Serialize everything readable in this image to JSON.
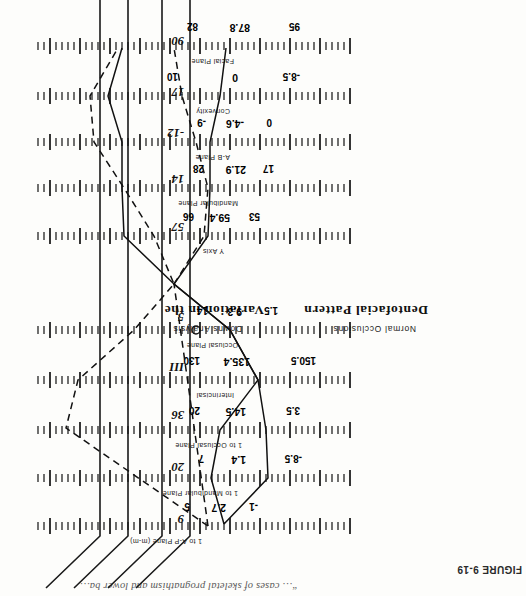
{
  "figure": {
    "label": "FIGURE 9-19",
    "caption": "“… cases of skeletal prognathism and lower ba…"
  },
  "titles": {
    "main_left": "Variation in the",
    "main_right": "Dentofacial Pattern",
    "sub_left": "Downs Analysis",
    "sub_right": "Normal Occlusions"
  },
  "chart_data": {
    "type": "table",
    "subtitle": "Downs Analysis — Normal Occlusions",
    "xlabel": "",
    "ylabel": "",
    "grid": false,
    "legend": "none",
    "note": "Polygon (wiggle) chart: each horizontal ruler is one cephalometric measurement; marks show minimum, mean and maximum of the normal range.",
    "columns": [
      "measurement",
      "min",
      "mean",
      "max",
      "unit"
    ],
    "rows": [
      {
        "measurement": "Facial Plane",
        "min": "95",
        "mean": "87.8",
        "max": "82",
        "unit": "degrees"
      },
      {
        "measurement": "Convexity",
        "min": "-8.5",
        "mean": "0",
        "max": "10",
        "unit": "degrees"
      },
      {
        "measurement": "A-B Plane",
        "min": "0",
        "mean": "-4.6",
        "max": "-9",
        "unit": "degrees"
      },
      {
        "measurement": "Mandibular Plane",
        "min": "17",
        "mean": "21.9",
        "max": "28",
        "unit": "degrees"
      },
      {
        "measurement": "Y Axis",
        "min": "53",
        "mean": "59.4",
        "max": "66",
        "unit": "degrees"
      },
      {
        "measurement": "Occlusal Plane",
        "min": "1.5",
        "mean": "9.3",
        "max": "14",
        "unit": "degrees"
      },
      {
        "measurement": "Interincisal",
        "min": "150.5",
        "mean": "135.4",
        "max": "130",
        "unit": "degrees"
      },
      {
        "measurement": "1 to Occlusal Plane",
        "min": "3.5",
        "mean": "14.5",
        "max": "20",
        "unit": "degrees"
      },
      {
        "measurement": "1 to Mandibular Plane",
        "min": "-8.5",
        "mean": "1.4",
        "max": "7",
        "unit": "degrees"
      },
      {
        "measurement": "1 to A-P Plane (m-m)",
        "min": "-1",
        "mean": "2.7",
        "max": "5",
        "unit": "mm"
      }
    ],
    "scale_numbers": [
      "90",
      "17",
      "-12",
      "14",
      "57",
      "5",
      "III",
      "36",
      "20",
      "9"
    ]
  },
  "rows": [
    {
      "label": "1 to A-P Plane (m-m)",
      "min": "-1",
      "mean": "2.7",
      "max": "5",
      "label_x": 148,
      "min_x": 92,
      "mean_x": 124,
      "max_x": 160
    },
    {
      "label": "1 to Mandibular Plane",
      "min": "-8.5",
      "mean": "1.4",
      "max": "7",
      "label_x": 112,
      "min_x": 48,
      "mean_x": 104,
      "max_x": 146
    },
    {
      "label": "1 to Occlusal Plane",
      "min": "3.5",
      "mean": "14.5",
      "max": "20",
      "label_x": 108,
      "min_x": 50,
      "mean_x": 104,
      "max_x": 150
    },
    {
      "label": "Interincisal",
      "min": "150.5",
      "mean": "135.4",
      "max": "130",
      "label_x": 116,
      "min_x": 34,
      "mean_x": 100,
      "max_x": 150
    },
    {
      "label": "Occlusal Plane",
      "min": "1.5",
      "mean": "9.3",
      "max": "14",
      "label_x": 112,
      "min_x": 72,
      "mean_x": 108,
      "max_x": 142
    },
    {
      "label": "Y Axis",
      "min": "53",
      "mean": "59.4",
      "max": "66",
      "label_x": 126,
      "min_x": 90,
      "mean_x": 120,
      "max_x": 156
    },
    {
      "label": "Mandibular Plane",
      "min": "17",
      "mean": "21.9",
      "max": "28",
      "label_x": 112,
      "min_x": 76,
      "mean_x": 104,
      "max_x": 146
    },
    {
      "label": "A-B Plane",
      "min": "0",
      "mean": "-4.6",
      "max": "-9",
      "label_x": 120,
      "min_x": 78,
      "mean_x": 106,
      "max_x": 144
    },
    {
      "label": "Convexity",
      "min": "-8.5",
      "mean": "0",
      "max": "10",
      "label_x": 120,
      "min_x": 50,
      "mean_x": 112,
      "max_x": 172
    },
    {
      "label": "Facial Plane",
      "min": "95",
      "mean": "87.8",
      "max": "82",
      "label_x": 116,
      "min_x": 50,
      "mean_x": 100,
      "max_x": 152
    }
  ],
  "scale_numbers": [
    {
      "text": "9",
      "y": 70
    },
    {
      "text": "20",
      "y": 122
    },
    {
      "text": "36",
      "y": 174
    },
    {
      "text": "III",
      "y": 222
    },
    {
      "text": "5",
      "y": 272
    },
    {
      "text": "57",
      "y": 362
    },
    {
      "text": "14",
      "y": 410
    },
    {
      "text": "-12",
      "y": 456
    },
    {
      "text": "17",
      "y": 497
    },
    {
      "text": "90",
      "y": 548
    }
  ]
}
